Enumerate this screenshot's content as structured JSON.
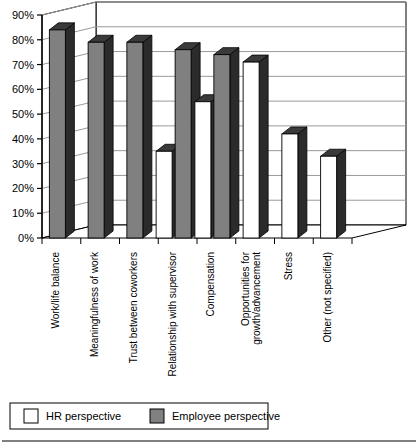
{
  "chart_data": {
    "type": "bar",
    "title": "",
    "subtitle": "",
    "xlabel": "",
    "ylabel": "",
    "ylim": [
      0,
      90
    ],
    "grid": true,
    "legend_position": "bottom",
    "projection": "3d",
    "categories": [
      "Work/life balance",
      "Meaningfulness of work",
      "Trust between coworkers",
      "Relationship with supervisor",
      "Compensation",
      "Opportunities for growth/advancement",
      "Stress",
      "Other (not specified)"
    ],
    "series": [
      {
        "name": "HR perspective",
        "color": "#ffffff",
        "values": [
          null,
          null,
          null,
          35,
          55,
          71,
          42,
          33
        ]
      },
      {
        "name": "Employee perspective",
        "color": "#808080",
        "values": [
          84,
          79,
          79,
          76,
          74,
          null,
          null,
          null
        ]
      }
    ],
    "yticks": [
      "0%",
      "10%",
      "20%",
      "30%",
      "40%",
      "50%",
      "60%",
      "70%",
      "80%",
      "90%"
    ],
    "ytick_values": [
      0,
      10,
      20,
      30,
      40,
      50,
      60,
      70,
      80,
      90
    ]
  },
  "legend": {
    "items": [
      {
        "label": "HR perspective",
        "swatch": "#ffffff"
      },
      {
        "label": "Employee perspective",
        "swatch": "#808080"
      }
    ]
  },
  "axis": {
    "y_labels": [
      "90%",
      "80%",
      "70%",
      "60%",
      "50%",
      "40%",
      "30%",
      "20%",
      "10%",
      "0%"
    ]
  },
  "colors": {
    "bar_hr_face": "#ffffff",
    "bar_emp_face": "#808080",
    "bar_side": "#2b2b2b",
    "bar_top": "#3a3a3a",
    "bar_outline": "#000000",
    "grid": "#9a9a9a",
    "axis": "#000000",
    "background": "#ffffff"
  }
}
